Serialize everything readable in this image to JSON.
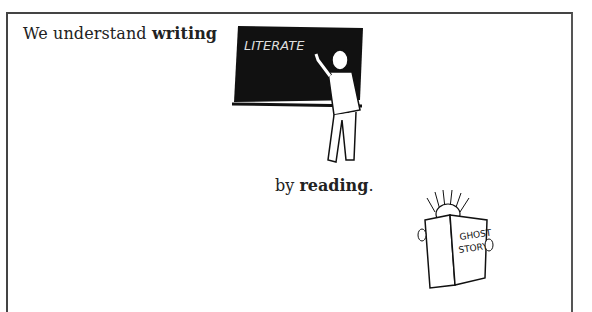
{
  "slide": {
    "line1": {
      "prefix": "We understand ",
      "emphasis": "writing"
    },
    "line2": {
      "prefix": "by ",
      "emphasis": "reading",
      "suffix": "."
    },
    "illustrations": {
      "teacher": {
        "description": "man writing on chalkboard",
        "chalkboard_text": "LITERATE"
      },
      "reader": {
        "description": "person reading book",
        "book_title_line1": "GHOST",
        "book_title_line2": "STORY"
      }
    }
  }
}
